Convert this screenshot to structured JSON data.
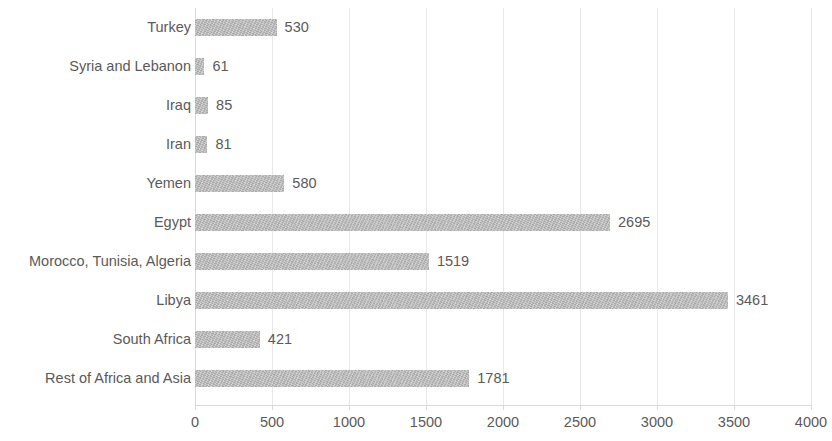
{
  "chart_data": {
    "type": "bar",
    "orientation": "horizontal",
    "title": "",
    "subtitle": "",
    "xlabel": "",
    "ylabel": "",
    "xlim": [
      0,
      4000
    ],
    "grid": true,
    "legend": false,
    "legend_position": "none",
    "bar_color": "#b3b3b3",
    "text_color": "#5a5a5a",
    "gridline_color": "#e8e8e8",
    "x_ticks": [
      "0",
      "500",
      "1000",
      "1500",
      "2000",
      "2500",
      "3000",
      "3500",
      "4000"
    ],
    "x_tick_values": [
      0,
      500,
      1000,
      1500,
      2000,
      2500,
      3000,
      3500,
      4000
    ],
    "categories": [
      "Turkey",
      "Syria and Lebanon",
      "Iraq",
      "Iran",
      "Yemen",
      "Egypt",
      "Morocco, Tunisia, Algeria",
      "Libya",
      "South Africa",
      "Rest of Africa and Asia"
    ],
    "values": [
      530,
      61,
      85,
      81,
      580,
      2695,
      1519,
      3461,
      421,
      1781
    ],
    "data_labels": [
      "530",
      "61",
      "85",
      "81",
      "580",
      "2695",
      "1519",
      "3461",
      "421",
      "1781"
    ]
  }
}
